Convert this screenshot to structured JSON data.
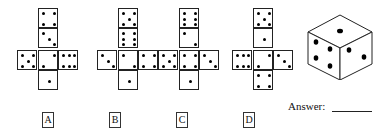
{
  "question": {
    "nets": [
      {
        "label": "A",
        "left": 17,
        "faces": {
          "top": 4,
          "upper": 3,
          "left": 5,
          "center": 2,
          "right": 6,
          "bottom": 1
        }
      },
      {
        "label": "B",
        "left": 97,
        "faces": {
          "top": 5,
          "upper": 6,
          "left": 3,
          "center": 2,
          "right": 4,
          "bottom": 1
        }
      },
      {
        "label": "C",
        "left": 158,
        "faces": {
          "top": 6,
          "upper": 2,
          "left": 5,
          "center": 4,
          "right": 3,
          "bottom": 1
        }
      },
      {
        "label": "D",
        "left": 232,
        "faces": {
          "top": 5,
          "upper": 1,
          "left": 6,
          "center": 2,
          "right": 3,
          "bottom": 4
        }
      }
    ],
    "cube": {
      "top": 1,
      "left": 4,
      "right": 2
    },
    "answer_label": "Answer:"
  }
}
